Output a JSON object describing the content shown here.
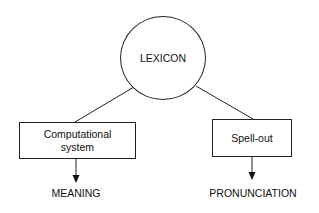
{
  "diagram": {
    "root": {
      "label": "LEXICON",
      "shape": "circle"
    },
    "branches": [
      {
        "box_label_line1": "Computational",
        "box_label_line2": "system",
        "output": "MEANING"
      },
      {
        "box_label_line1": "Spell-out",
        "box_label_line2": "",
        "output": "PRONUNCIATION"
      }
    ],
    "colors": {
      "stroke": "#222222",
      "background": "#ffffff",
      "text": "#111111"
    }
  }
}
